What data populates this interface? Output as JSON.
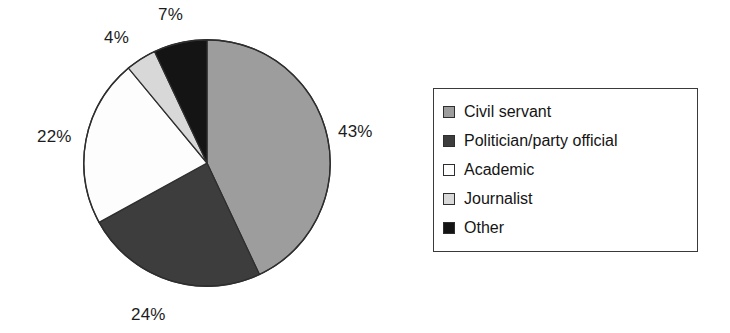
{
  "chart_data": {
    "type": "pie",
    "title": "",
    "subtitle": "",
    "xlabel": "",
    "ylabel": "",
    "grid": false,
    "legend_position": "right",
    "start_angle_deg": 0,
    "direction": "clockwise",
    "categories": [
      "Civil servant",
      "Politician/party official",
      "Academic",
      "Journalist",
      "Other"
    ],
    "values": [
      43,
      24,
      22,
      4,
      7
    ],
    "value_unit": "%",
    "data_labels": [
      "43%",
      "24%",
      "22%",
      "4%",
      "7%"
    ],
    "colors": [
      "#9d9d9d",
      "#3d3d3d",
      "#fdfdfd",
      "#d8d8d8",
      "#141414"
    ],
    "slice_edge_color": "#2e2e2e",
    "slices": [
      {
        "label": "Civil servant",
        "value": 43,
        "data_label": "43%",
        "color": "#9d9d9d"
      },
      {
        "label": "Politician/party official",
        "value": 24,
        "data_label": "24%",
        "color": "#3d3d3d"
      },
      {
        "label": "Academic",
        "value": 22,
        "data_label": "22%",
        "color": "#fdfdfd"
      },
      {
        "label": "Journalist",
        "value": 4,
        "data_label": "4%",
        "color": "#d8d8d8"
      },
      {
        "label": "Other",
        "value": 7,
        "data_label": "7%",
        "color": "#141414"
      }
    ]
  },
  "legend": {
    "items": [
      {
        "label": "Civil servant",
        "color": "#9d9d9d"
      },
      {
        "label": "Politician/party official",
        "color": "#3d3d3d"
      },
      {
        "label": "Academic",
        "color": "#fdfdfd"
      },
      {
        "label": "Journalist",
        "color": "#d8d8d8"
      },
      {
        "label": "Other",
        "color": "#141414"
      }
    ]
  }
}
